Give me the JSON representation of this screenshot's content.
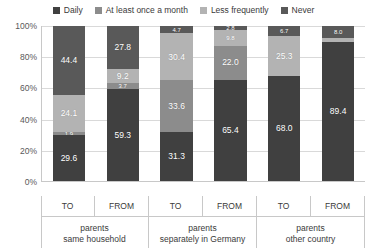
{
  "chart_data": {
    "type": "bar",
    "subtype": "stacked-100-percent",
    "title": "",
    "xlabel": "",
    "ylabel": "",
    "ylim": [
      0,
      100
    ],
    "ytick_labels": [
      "100%",
      "80%",
      "60%",
      "40%",
      "20%",
      "0%"
    ],
    "ytick_values": [
      100,
      80,
      60,
      40,
      20,
      0
    ],
    "grid": true,
    "legend_position": "top-center",
    "stack_order_bottom_to_top": [
      "Daily",
      "At least once a month",
      "Less frequently",
      "Never"
    ],
    "series": [
      {
        "name": "Daily",
        "color": "#404040",
        "values": [
          29.6,
          59.3,
          31.3,
          65.4,
          68.0,
          89.4
        ]
      },
      {
        "name": "At least once a month",
        "color": "#8c8c8c",
        "values": [
          1.9,
          3.7,
          33.6,
          22.0,
          25.3,
          2.6
        ]
      },
      {
        "name": "Less frequently",
        "color": "#b3b3b3",
        "values": [
          24.1,
          9.2,
          30.4,
          9.8,
          0.0,
          0.0
        ]
      },
      {
        "name": "Never",
        "color": "#595959",
        "values": [
          44.4,
          27.8,
          4.7,
          2.8,
          6.7,
          8.0
        ]
      }
    ],
    "categories": [
      "TO",
      "FROM",
      "TO",
      "FROM",
      "TO",
      "FROM"
    ],
    "groups": [
      {
        "label_line1": "parents",
        "label_line2": "same household",
        "bars": [
          {
            "label": "TO",
            "segments": [
              {
                "series": "Never",
                "value": 44.4,
                "display": "44.4",
                "show": true,
                "tiny": false
              },
              {
                "series": "Less frequently",
                "value": 24.1,
                "display": "24.1",
                "show": true,
                "tiny": false
              },
              {
                "series": "At least once a month",
                "value": 1.9,
                "display": "1.9",
                "show": true,
                "tiny": true
              },
              {
                "series": "Daily",
                "value": 29.6,
                "display": "29.6",
                "show": true,
                "tiny": false
              }
            ]
          },
          {
            "label": "FROM",
            "segments": [
              {
                "series": "Never",
                "value": 27.8,
                "display": "27.8",
                "show": true,
                "tiny": false
              },
              {
                "series": "Less frequently",
                "value": 9.2,
                "display": "9.2",
                "show": true,
                "tiny": false
              },
              {
                "series": "At least once a month",
                "value": 3.7,
                "display": "3.7",
                "show": true,
                "tiny": true
              },
              {
                "series": "Daily",
                "value": 59.3,
                "display": "59.3",
                "show": true,
                "tiny": false
              }
            ]
          }
        ]
      },
      {
        "label_line1": "parents",
        "label_line2": "separately in Germany",
        "bars": [
          {
            "label": "TO",
            "segments": [
              {
                "series": "Never",
                "value": 4.7,
                "display": "4.7",
                "show": true,
                "tiny": true
              },
              {
                "series": "Less frequently",
                "value": 30.4,
                "display": "30.4",
                "show": true,
                "tiny": false
              },
              {
                "series": "At least once a month",
                "value": 33.6,
                "display": "33.6",
                "show": true,
                "tiny": false
              },
              {
                "series": "Daily",
                "value": 31.3,
                "display": "31.3",
                "show": true,
                "tiny": false
              }
            ]
          },
          {
            "label": "FROM",
            "segments": [
              {
                "series": "Never",
                "value": 2.8,
                "display": "2.8",
                "show": true,
                "tiny": true
              },
              {
                "series": "Less frequently",
                "value": 9.8,
                "display": "9.8",
                "show": true,
                "tiny": true
              },
              {
                "series": "At least once a month",
                "value": 22.0,
                "display": "22.0",
                "show": true,
                "tiny": false
              },
              {
                "series": "Daily",
                "value": 65.4,
                "display": "65.4",
                "show": true,
                "tiny": false
              }
            ]
          }
        ]
      },
      {
        "label_line1": "parents",
        "label_line2": "other country",
        "bars": [
          {
            "label": "TO",
            "segments": [
              {
                "series": "Never",
                "value": 6.7,
                "display": "6.7",
                "show": true,
                "tiny": true
              },
              {
                "series": "Less frequently",
                "value": 25.3,
                "display": "25.3",
                "show": true,
                "tiny": false
              },
              {
                "series": "At least once a month",
                "value": 0.0,
                "display": "",
                "show": false,
                "tiny": true
              },
              {
                "series": "Daily",
                "value": 68.0,
                "display": "68.0",
                "show": true,
                "tiny": false
              }
            ]
          },
          {
            "label": "FROM",
            "segments": [
              {
                "series": "Never",
                "value": 8.0,
                "display": "8.0",
                "show": true,
                "tiny": true
              },
              {
                "series": "Less frequently",
                "value": 2.6,
                "display": "",
                "show": false,
                "tiny": true
              },
              {
                "series": "At least once a month",
                "value": 0.0,
                "display": "",
                "show": false,
                "tiny": true
              },
              {
                "series": "Daily",
                "value": 89.4,
                "display": "89.4",
                "show": true,
                "tiny": false
              }
            ]
          }
        ]
      }
    ]
  },
  "legend": {
    "items": [
      {
        "label": "Daily",
        "color": "#404040"
      },
      {
        "label": "At least once a month",
        "color": "#8c8c8c"
      },
      {
        "label": "Less frequently",
        "color": "#b3b3b3"
      },
      {
        "label": "Never",
        "color": "#595959"
      }
    ]
  },
  "colors": {
    "daily": "#404040",
    "at_least_once_a_month": "#8c8c8c",
    "less_frequently": "#b3b3b3",
    "never": "#595959",
    "gridline": "#d9d9d9",
    "axis": "#c8c8c8",
    "text": "#3a3a3a",
    "background": "#ffffff"
  }
}
